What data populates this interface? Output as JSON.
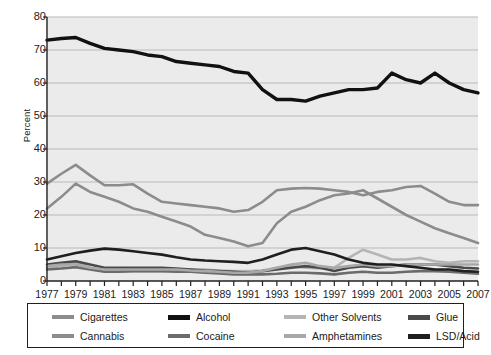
{
  "chart_data": {
    "type": "line",
    "title": "",
    "xlabel": "",
    "ylabel": "Percent",
    "ylim": [
      0,
      80
    ],
    "ytick_values": [
      0,
      10,
      20,
      30,
      40,
      50,
      60,
      70,
      80
    ],
    "ytick_labels": [
      "0",
      "10",
      "20",
      "30",
      "40",
      "50",
      "60",
      "70",
      "80"
    ],
    "grid": true,
    "legend_position": "bottom",
    "x": [
      1977,
      1978,
      1979,
      1980,
      1981,
      1982,
      1983,
      1984,
      1985,
      1986,
      1987,
      1988,
      1989,
      1990,
      1991,
      1992,
      1993,
      1994,
      1995,
      1996,
      1997,
      1998,
      1999,
      2000,
      2001,
      2002,
      2003,
      2004,
      2005,
      2006,
      2007
    ],
    "xtick_labels": [
      "1977",
      "1979",
      "1981",
      "1983",
      "1985",
      "1987",
      "1989",
      "1991",
      "1993",
      "1995",
      "1997",
      "1999",
      "2001",
      "2003",
      "2005",
      "2007"
    ],
    "xtick_values": [
      1977,
      1979,
      1981,
      1983,
      1985,
      1987,
      1989,
      1991,
      1993,
      1995,
      1997,
      1999,
      2001,
      2003,
      2005,
      2007
    ],
    "series": [
      {
        "name": "Cigarettes",
        "color": "#8c8c8c",
        "width": 2.6,
        "values": [
          29.5,
          32.5,
          35.2,
          32.0,
          29.0,
          29.0,
          29.3,
          26.5,
          24.0,
          23.5,
          23.0,
          22.5,
          22.0,
          21.0,
          21.5,
          24.0,
          27.5,
          28.0,
          28.2,
          28.0,
          27.5,
          27.0,
          26.0,
          27.0,
          27.5,
          28.5,
          28.8,
          26.5,
          24.0,
          23.0,
          23.0
        ]
      },
      {
        "name": "Alcohol",
        "color": "#111111",
        "width": 3.4,
        "values": [
          73.0,
          73.5,
          73.8,
          72.0,
          70.5,
          70.0,
          69.5,
          68.5,
          68.0,
          66.5,
          66.0,
          65.5,
          65.0,
          63.5,
          63.0,
          58.0,
          55.0,
          55.0,
          54.5,
          56.0,
          57.0,
          58.0,
          58.0,
          58.5,
          63.0,
          61.0,
          60.0,
          63.0,
          60.0,
          58.0,
          57.0
        ]
      },
      {
        "name": "Other Solvents",
        "color": "#b5b5b5",
        "width": 2.6,
        "values": [
          4.0,
          4.5,
          5.5,
          4.0,
          3.0,
          3.0,
          3.0,
          3.0,
          3.0,
          3.2,
          3.5,
          3.5,
          3.2,
          3.0,
          3.0,
          3.2,
          4.0,
          4.5,
          4.0,
          3.8,
          4.0,
          7.0,
          9.5,
          8.0,
          6.5,
          6.5,
          7.0,
          6.0,
          5.5,
          6.0,
          6.0
        ]
      },
      {
        "name": "Glue",
        "color": "#4a4a4a",
        "width": 2.6,
        "values": [
          5.0,
          5.5,
          6.0,
          5.0,
          4.0,
          4.0,
          4.0,
          4.0,
          4.0,
          3.8,
          3.5,
          3.2,
          3.0,
          2.8,
          2.5,
          3.0,
          3.5,
          4.0,
          4.5,
          4.0,
          3.0,
          4.0,
          4.5,
          4.0,
          4.5,
          5.0,
          5.0,
          5.0,
          4.5,
          4.0,
          3.8
        ]
      },
      {
        "name": "Cannabis",
        "color": "#8c8c8c",
        "width": 2.6,
        "values": [
          22.0,
          25.5,
          29.5,
          27.0,
          25.5,
          24.0,
          22.0,
          21.0,
          19.5,
          18.0,
          16.5,
          14.0,
          13.0,
          12.0,
          10.5,
          11.5,
          17.5,
          21.0,
          22.5,
          24.5,
          26.0,
          26.5,
          27.5,
          25.0,
          22.5,
          20.0,
          18.0,
          16.0,
          14.5,
          13.0,
          11.5
        ]
      },
      {
        "name": "Cocaine",
        "color": "#6b6b6b",
        "width": 2.6,
        "values": [
          3.5,
          3.8,
          4.2,
          3.5,
          2.8,
          2.8,
          3.0,
          3.0,
          3.0,
          2.8,
          2.8,
          2.5,
          2.3,
          2.0,
          2.0,
          2.0,
          2.2,
          2.5,
          2.5,
          2.3,
          2.0,
          2.5,
          2.8,
          2.5,
          2.5,
          2.8,
          3.0,
          3.0,
          2.8,
          2.5,
          2.2
        ]
      },
      {
        "name": "Amphetamines",
        "color": "#a8a8a8",
        "width": 2.6,
        "values": [
          4.5,
          5.0,
          5.0,
          4.0,
          3.5,
          3.5,
          3.5,
          3.5,
          3.5,
          3.5,
          3.2,
          3.0,
          2.8,
          2.5,
          2.5,
          3.0,
          4.0,
          5.0,
          5.5,
          4.5,
          4.0,
          4.5,
          5.0,
          4.5,
          4.5,
          5.0,
          5.0,
          5.0,
          5.0,
          5.0,
          5.0
        ]
      },
      {
        "name": "LSD/Acid",
        "color": "#1f1f1f",
        "width": 2.6,
        "values": [
          6.5,
          7.5,
          8.5,
          9.2,
          9.8,
          9.5,
          9.0,
          8.5,
          8.0,
          7.2,
          6.5,
          6.2,
          6.0,
          5.8,
          5.5,
          6.5,
          8.0,
          9.5,
          10.0,
          9.0,
          8.0,
          6.5,
          5.5,
          5.0,
          5.0,
          4.5,
          4.0,
          3.5,
          3.5,
          3.0,
          2.8
        ]
      }
    ]
  },
  "legend": {
    "items": [
      {
        "label": "Cigarettes",
        "color": "#8c8c8c",
        "thick": false
      },
      {
        "label": "Alcohol",
        "color": "#111111",
        "thick": true
      },
      {
        "label": "Other Solvents",
        "color": "#b5b5b5",
        "thick": false
      },
      {
        "label": "Glue",
        "color": "#4a4a4a",
        "thick": true
      },
      {
        "label": "Cannabis",
        "color": "#8c8c8c",
        "thick": false
      },
      {
        "label": "Cocaine",
        "color": "#6b6b6b",
        "thick": false
      },
      {
        "label": "Amphetamines",
        "color": "#a8a8a8",
        "thick": false
      },
      {
        "label": "LSD/Acid",
        "color": "#1f1f1f",
        "thick": true
      }
    ]
  },
  "style": {
    "plot_background": "#ebebeb",
    "gridline_color": "#b9b9b9",
    "axis_color": "#231f20",
    "text_color": "#1a1a1a",
    "page_background": "#ffffff"
  }
}
